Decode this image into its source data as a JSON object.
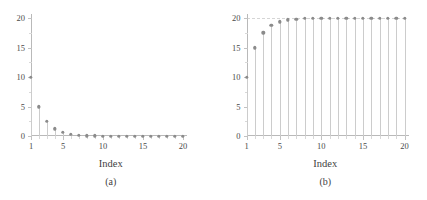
{
  "figure": {
    "panels": [
      {
        "caption": "(a)",
        "xlabel": "Index",
        "ylabel": ""
      },
      {
        "caption": "(b)",
        "xlabel": "Index",
        "ylabel": ""
      }
    ]
  },
  "chart_data": [
    {
      "type": "line",
      "subtype": "stem",
      "title": "",
      "caption": "(a)",
      "xlabel": "Index",
      "ylabel": "",
      "xlim": [
        1,
        20
      ],
      "ylim": [
        0,
        20
      ],
      "xticks": [
        1,
        5,
        10,
        15,
        20
      ],
      "xticklabels": [
        "1",
        "5",
        "10",
        "15",
        "20"
      ],
      "yticks": [
        0,
        5,
        10,
        15,
        20
      ],
      "yticklabels": [
        "0",
        "5",
        "10",
        "15",
        "20"
      ],
      "yminorticks": [
        2.5,
        7.5,
        12.5,
        17.5
      ],
      "grid": false,
      "legend": null,
      "marker": "filled-circle",
      "marker_color": "#8b8b8b",
      "stem_color": "#cccccc",
      "axis_color": "#b9b9b9",
      "x": [
        1,
        2,
        3,
        4,
        5,
        6,
        7,
        8,
        9,
        10,
        11,
        12,
        13,
        14,
        15,
        16,
        17,
        18,
        19,
        20
      ],
      "values": [
        10,
        5,
        2.5,
        1.25,
        0.63,
        0.31,
        0.16,
        0.08,
        0.04,
        0.02,
        0.01,
        0.005,
        0.002,
        0.001,
        0.001,
        0,
        0,
        0,
        0,
        0
      ]
    },
    {
      "type": "line",
      "subtype": "stem",
      "title": "",
      "caption": "(b)",
      "xlabel": "Index",
      "ylabel": "",
      "xlim": [
        1,
        20
      ],
      "ylim": [
        0,
        20
      ],
      "xticks": [
        1,
        5,
        10,
        15,
        20
      ],
      "xticklabels": [
        "1",
        "5",
        "10",
        "15",
        "20"
      ],
      "yticks": [
        0,
        5,
        10,
        15,
        20
      ],
      "yticklabels": [
        "0",
        "5",
        "10",
        "15",
        "20"
      ],
      "yminorticks": [
        2.5,
        7.5,
        12.5,
        17.5
      ],
      "grid": false,
      "reference_line": 20,
      "legend": null,
      "marker": "filled-circle",
      "marker_color": "#8b8b8b",
      "stem_color": "#cccccc",
      "axis_color": "#b9b9b9",
      "x": [
        1,
        2,
        3,
        4,
        5,
        6,
        7,
        8,
        9,
        10,
        11,
        12,
        13,
        14,
        15,
        16,
        17,
        18,
        19,
        20
      ],
      "values": [
        10,
        15,
        17.5,
        18.75,
        19.38,
        19.69,
        19.84,
        19.92,
        19.96,
        19.98,
        19.99,
        19.995,
        19.998,
        19.999,
        20,
        20,
        20,
        20,
        20,
        20
      ]
    }
  ]
}
